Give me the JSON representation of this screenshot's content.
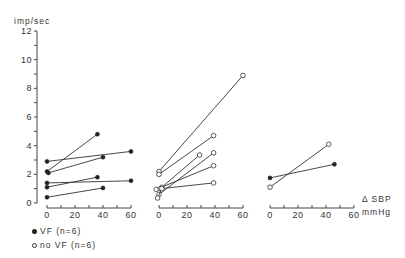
{
  "chart_data": {
    "type": "line",
    "title": "",
    "ylabel": "imp/sec",
    "xlabel": "Δ SBP",
    "xunit": "mmHg",
    "ylim": [
      0,
      12
    ],
    "yticks": [
      0,
      2,
      4,
      6,
      8,
      10,
      12
    ],
    "xlim": [
      0,
      60
    ],
    "xticks": [
      0,
      20,
      40,
      60
    ],
    "grid": false,
    "legend_position": "bottom-left",
    "panels": [
      {
        "name": "panel-1",
        "series": [
          {
            "group": "VF",
            "marker": "filled",
            "x": [
              0,
              36
            ],
            "y": [
              2.2,
              4.8
            ]
          },
          {
            "group": "VF",
            "marker": "filled",
            "x": [
              0,
              60
            ],
            "y": [
              2.9,
              3.6
            ]
          },
          {
            "group": "VF",
            "marker": "filled",
            "x": [
              1,
              40
            ],
            "y": [
              2.1,
              3.2
            ]
          },
          {
            "group": "VF",
            "marker": "filled",
            "x": [
              0,
              36
            ],
            "y": [
              1.1,
              1.8
            ]
          },
          {
            "group": "VF",
            "marker": "filled",
            "x": [
              0,
              60
            ],
            "y": [
              1.4,
              1.55
            ]
          },
          {
            "group": "VF",
            "marker": "filled",
            "x": [
              0,
              40
            ],
            "y": [
              0.4,
              1.05
            ]
          }
        ]
      },
      {
        "name": "panel-2",
        "series": [
          {
            "group": "no VF",
            "marker": "open",
            "x": [
              0,
              60
            ],
            "y": [
              2.2,
              8.9
            ]
          },
          {
            "group": "no VF",
            "marker": "open",
            "x": [
              0,
              39
            ],
            "y": [
              2.0,
              4.7
            ]
          },
          {
            "group": "no VF",
            "marker": "open",
            "x": [
              2,
              29
            ],
            "y": [
              1.1,
              3.35
            ]
          },
          {
            "group": "no VF",
            "marker": "open",
            "x": [
              0,
              39
            ],
            "y": [
              0.6,
              3.5
            ]
          },
          {
            "group": "no VF",
            "marker": "open",
            "x": [
              -2,
              39
            ],
            "y": [
              0.95,
              2.6
            ]
          },
          {
            "group": "no VF",
            "marker": "open",
            "x": [
              1,
              39
            ],
            "y": [
              1.0,
              1.4
            ]
          },
          {
            "group": "no VF",
            "marker": "open",
            "x": [
              -1,
              2
            ],
            "y": [
              0.35,
              1.0
            ]
          }
        ]
      },
      {
        "name": "panel-3",
        "series": [
          {
            "group": "VF",
            "marker": "filled",
            "x": [
              0,
              46
            ],
            "y": [
              1.75,
              2.7
            ]
          },
          {
            "group": "no VF",
            "marker": "open",
            "x": [
              0,
              42
            ],
            "y": [
              1.1,
              4.1
            ]
          }
        ]
      }
    ],
    "legend": [
      {
        "label": "VF (n=6)",
        "marker": "filled"
      },
      {
        "label": "no VF (n=6)",
        "marker": "open"
      }
    ]
  },
  "axis": {
    "y_title": "imp/sec",
    "x_title": "Δ SBP",
    "x_unit": "mmHg"
  },
  "legend": {
    "vf": "VF (n=6)",
    "novf": "no VF (n=6)"
  }
}
